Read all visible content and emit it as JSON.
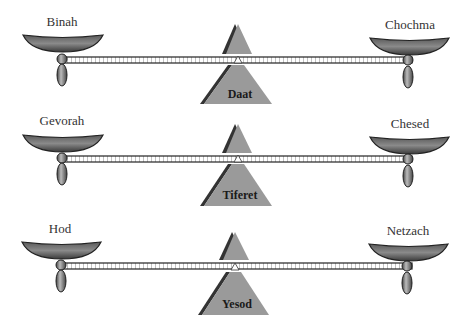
{
  "diagram": {
    "type": "balance-scales",
    "colors": {
      "pan": "#7a7a7a",
      "pan_dark": "#2a2a2a",
      "fulcrum": "#9a9a9a",
      "fulcrum_shadow": "#333333",
      "beam": "#222222",
      "background": "#ffffff"
    },
    "scales": [
      {
        "left": "Binah",
        "right": "Chochma",
        "center": "Daat"
      },
      {
        "left": "Gevorah",
        "right": "Chesed",
        "center": "Tiferet"
      },
      {
        "left": "Hod",
        "right": "Netzach",
        "center": "Yesod"
      }
    ]
  }
}
